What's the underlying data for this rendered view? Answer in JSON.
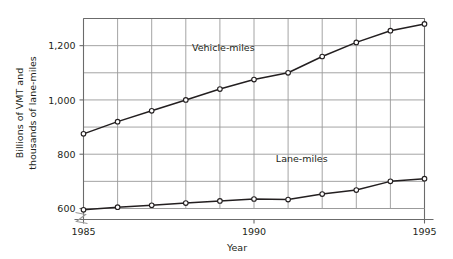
{
  "chart_data": {
    "type": "line",
    "title": "",
    "xlabel": "Year",
    "ylabel": "Billions of VMT and thousands of lane-miles",
    "ylabel_line1": "Billions of VMT and",
    "ylabel_line2": "thousands of lane-miles",
    "x": [
      1985,
      1986,
      1987,
      1988,
      1989,
      1990,
      1991,
      1992,
      1993,
      1994,
      1995
    ],
    "xlim": [
      1985,
      1995
    ],
    "ylim": [
      600,
      1300
    ],
    "xticks": [
      1985,
      1990,
      1995
    ],
    "xtick_labels": [
      "1985",
      "1990",
      "1995"
    ],
    "yticks": [
      600,
      800,
      1000,
      1200
    ],
    "ytick_labels": [
      "600",
      "800",
      "1,000",
      "1,200"
    ],
    "gridlines_y": [
      600,
      700,
      800,
      900,
      1000,
      1100,
      1200,
      1300
    ],
    "gridlines_x": [
      1985,
      1986,
      1987,
      1988,
      1989,
      1990,
      1991,
      1992,
      1993,
      1994,
      1995
    ],
    "grid": true,
    "axis_break": true,
    "axis_break_note": "zigzag break on y-axis below 600",
    "legend_position": "inline-annotation",
    "marker": "open-circle",
    "line_color": "#231f20",
    "grid_color": "#9a9a9a",
    "marker_fill": "#ffffff",
    "series": [
      {
        "name": "Vehicle-miles",
        "label_x": 1989.1,
        "label_y": 1182,
        "values": [
          875,
          920,
          960,
          1000,
          1040,
          1075,
          1100,
          1160,
          1212,
          1255,
          1280
        ]
      },
      {
        "name": "Lane-miles",
        "label_x": 1991.4,
        "label_y": 770,
        "values": [
          595,
          605,
          612,
          620,
          628,
          635,
          633,
          653,
          668,
          700,
          710
        ]
      }
    ]
  }
}
